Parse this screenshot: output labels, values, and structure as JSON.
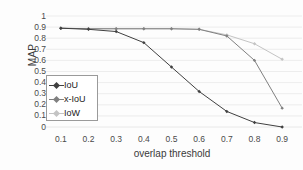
{
  "chart_data": {
    "type": "line",
    "title": "",
    "xlabel": "overlap threshold",
    "ylabel": "MAP",
    "x": [
      0.1,
      0.2,
      0.3,
      0.4,
      0.5,
      0.6,
      0.7,
      0.8,
      0.9
    ],
    "xtick_labels": [
      "0.1",
      "0.2",
      "0.3",
      "0.4",
      "0.5",
      "0.6",
      "0.7",
      "0.8",
      "0.9"
    ],
    "ytick_labels": [
      "1",
      "0.9",
      "0.8",
      "0.7",
      "0.6",
      "0.5",
      "0.4",
      "0.3",
      "0.2",
      "0.1",
      "0"
    ],
    "ytick_values": [
      1,
      0.9,
      0.8,
      0.7,
      0.6,
      0.5,
      0.4,
      0.3,
      0.2,
      0.1,
      0
    ],
    "xlim": [
      0.05,
      0.95
    ],
    "ylim": [
      0,
      1
    ],
    "grid": "horizontal",
    "grid_color": "#e8e8e8",
    "legend_position": "center-left-inside",
    "series": [
      {
        "name": "IoU",
        "color": "#404040",
        "marker": "diamond",
        "values": [
          0.89,
          0.88,
          0.86,
          0.76,
          0.54,
          0.32,
          0.14,
          0.04,
          0.0
        ]
      },
      {
        "name": "x-IoU",
        "color": "#808080",
        "marker": "diamond",
        "values": [
          0.89,
          0.885,
          0.885,
          0.885,
          0.885,
          0.88,
          0.82,
          0.6,
          0.17
        ]
      },
      {
        "name": "IoW",
        "color": "#c4c4c4",
        "marker": "diamond",
        "values": [
          0.89,
          0.885,
          0.885,
          0.885,
          0.885,
          0.88,
          0.83,
          0.75,
          0.61
        ]
      }
    ]
  },
  "legend": {
    "items": [
      {
        "label": "IoU"
      },
      {
        "label": "x-IoU"
      },
      {
        "label": "IoW"
      }
    ]
  }
}
